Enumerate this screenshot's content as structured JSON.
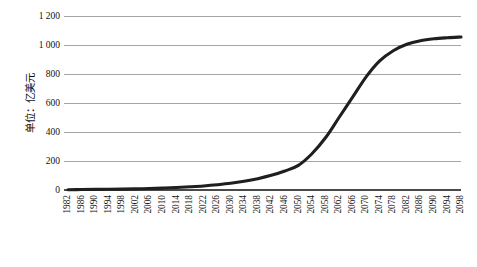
{
  "chart_data": {
    "type": "line",
    "title": "",
    "subtitle": "",
    "xlabel": "",
    "ylabel": "单位：亿美元",
    "ylim": [
      0,
      1200
    ],
    "xlim": [
      1982,
      2098
    ],
    "ytick_values": [
      0,
      200,
      400,
      600,
      800,
      1000,
      1200
    ],
    "ytick_labels": [
      "0",
      "200",
      "400",
      "600",
      "800",
      "1 000",
      "1 200"
    ],
    "grid": "horizontal",
    "legend": "none",
    "legend_entries": [],
    "annotations": [],
    "line_color": "#1f1f1f",
    "gridline_color": "#7f7f7f",
    "axis_color": "#4a4a4a",
    "background_color": "#ffffff",
    "categories": [
      "1982",
      "1986",
      "1990",
      "1994",
      "1998",
      "2002",
      "2006",
      "2010",
      "2014",
      "2018",
      "2022",
      "2026",
      "2030",
      "2034",
      "2038",
      "2042",
      "2046",
      "2050",
      "2054",
      "2058",
      "2062",
      "2066",
      "2070",
      "2074",
      "2078",
      "2082",
      "2086",
      "2090",
      "2094",
      "2098"
    ],
    "x": [
      1982,
      1986,
      1990,
      1994,
      1998,
      2002,
      2006,
      2010,
      2014,
      2018,
      2022,
      2026,
      2030,
      2034,
      2038,
      2042,
      2046,
      2050,
      2054,
      2058,
      2062,
      2066,
      2070,
      2074,
      2078,
      2082,
      2086,
      2090,
      2094,
      2098
    ],
    "values": [
      2,
      3,
      4,
      5,
      6,
      8,
      10,
      13,
      17,
      22,
      28,
      36,
      46,
      60,
      78,
      101,
      131,
      170,
      250,
      360,
      500,
      640,
      780,
      890,
      960,
      1005,
      1030,
      1043,
      1050,
      1055
    ],
    "series": [
      {
        "name": "",
        "values": [
          2,
          3,
          4,
          5,
          6,
          8,
          10,
          13,
          17,
          22,
          28,
          36,
          46,
          60,
          78,
          101,
          131,
          170,
          250,
          360,
          500,
          640,
          780,
          890,
          960,
          1005,
          1030,
          1043,
          1050,
          1055
        ]
      }
    ]
  }
}
